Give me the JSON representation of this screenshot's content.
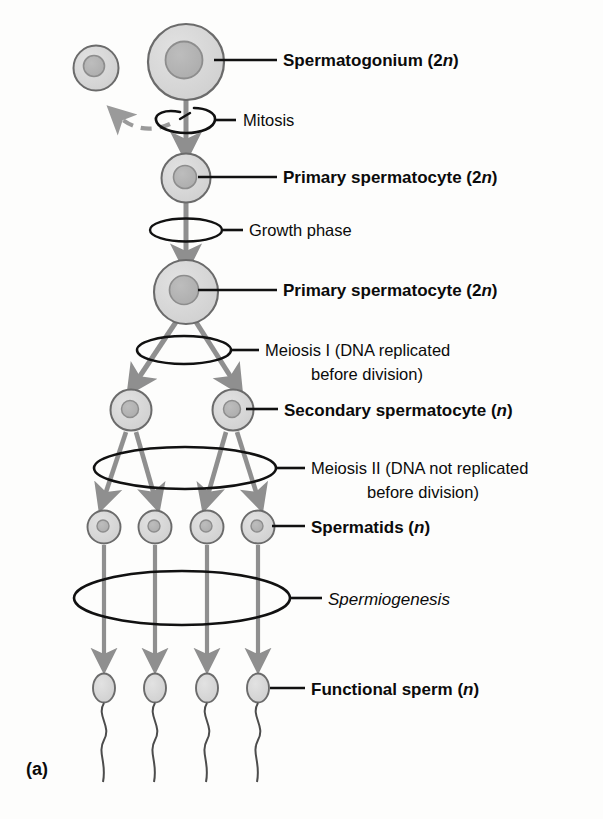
{
  "figure": {
    "panel_letter": "(a)",
    "title_implied": "Spermatogenesis",
    "colors": {
      "cytoplasm": "#d6d6d6",
      "nucleus": "#b3b3b3",
      "cell_outline": "#5a5a5a",
      "arrow": "#8a8a8a",
      "line": "#111111",
      "background": "#fdfdfc"
    }
  },
  "labels": {
    "spermatogonium": "Spermatogonium (2",
    "spermatogonium_ploidy": "n",
    "spermatogonium_close": ")",
    "mitosis": "Mitosis",
    "primary_spermatocyte_1": "Primary spermatocyte (2",
    "primary_spermatocyte_1_ploidy": "n",
    "primary_spermatocyte_1_close": ")",
    "growth_phase": "Growth phase",
    "primary_spermatocyte_2": "Primary spermatocyte (2",
    "primary_spermatocyte_2_ploidy": "n",
    "primary_spermatocyte_2_close": ")",
    "meiosis_one_line1": "Meiosis I (DNA replicated",
    "meiosis_one_line2": "before division)",
    "secondary_spermatocyte": "Secondary spermatocyte (",
    "secondary_spermatocyte_ploidy": "n",
    "secondary_spermatocyte_close": ")",
    "meiosis_two_line1": "Meiosis II (DNA not replicated",
    "meiosis_two_line2": "before division)",
    "spermatids": "Spermatids (",
    "spermatids_ploidy": "n",
    "spermatids_close": ")",
    "spermiogenesis": "Spermiogenesis",
    "functional_sperm": "Functional sperm (",
    "functional_sperm_ploidy": "n",
    "functional_sperm_close": ")"
  },
  "stages": [
    {
      "name": "spermatogonium",
      "cell_count": 2,
      "ploidy": "2n",
      "label": "Spermatogonium (2n)"
    },
    {
      "name": "primary-spermatocyte-early",
      "cell_count": 1,
      "ploidy": "2n",
      "label": "Primary spermatocyte (2n)"
    },
    {
      "name": "primary-spermatocyte-grown",
      "cell_count": 1,
      "ploidy": "2n",
      "label": "Primary spermatocyte (2n)"
    },
    {
      "name": "secondary-spermatocyte",
      "cell_count": 2,
      "ploidy": "n",
      "label": "Secondary spermatocyte (n)"
    },
    {
      "name": "spermatid",
      "cell_count": 4,
      "ploidy": "n",
      "label": "Spermatids (n)"
    },
    {
      "name": "functional-sperm",
      "cell_count": 4,
      "ploidy": "n",
      "label": "Functional sperm (n)"
    }
  ],
  "processes": [
    {
      "name": "mitosis",
      "label": "Mitosis"
    },
    {
      "name": "growth-phase",
      "label": "Growth phase"
    },
    {
      "name": "meiosis-i",
      "label": "Meiosis I (DNA replicated before division)"
    },
    {
      "name": "meiosis-ii",
      "label": "Meiosis II (DNA not replicated before division)"
    },
    {
      "name": "spermiogenesis",
      "label": "Spermiogenesis"
    }
  ]
}
